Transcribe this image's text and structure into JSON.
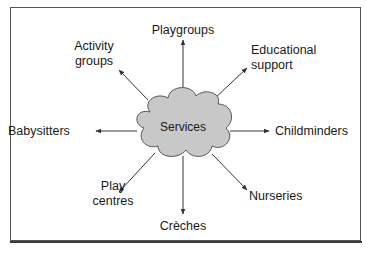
{
  "diagram": {
    "center": {
      "label": "Services",
      "fill": "#c8c8c8",
      "stroke": "#555555"
    },
    "nodes": [
      {
        "id": "playgroups",
        "lines": [
          "Playgroups"
        ]
      },
      {
        "id": "educational-support",
        "lines": [
          "Educational",
          "support"
        ]
      },
      {
        "id": "childminders",
        "lines": [
          "Childminders"
        ]
      },
      {
        "id": "nurseries",
        "lines": [
          "Nurseries"
        ]
      },
      {
        "id": "creches",
        "lines": [
          "Crèches"
        ]
      },
      {
        "id": "play-centres",
        "lines": [
          "Play",
          "centres"
        ]
      },
      {
        "id": "babysitters",
        "lines": [
          "Babysitters"
        ]
      },
      {
        "id": "activity-groups",
        "lines": [
          "Activity",
          "groups"
        ]
      }
    ],
    "arrow_color": "#333333"
  }
}
